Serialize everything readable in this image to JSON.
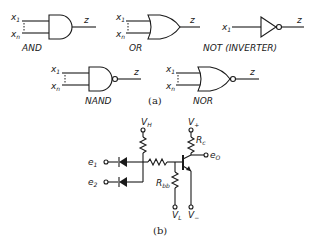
{
  "figure": {
    "part_a": {
      "caption": "(a)",
      "gates": [
        {
          "name": "AND",
          "label": "AND",
          "inputs": [
            "x1",
            "xn"
          ],
          "output": "z"
        },
        {
          "name": "OR",
          "label": "OR",
          "inputs": [
            "x1",
            "xn"
          ],
          "output": "z"
        },
        {
          "name": "NOT",
          "label": "NOT (INVERTER)",
          "inputs": [
            "x1"
          ],
          "output": "z"
        },
        {
          "name": "NAND",
          "label": "NAND",
          "inputs": [
            "x1",
            "xn"
          ],
          "output": "z"
        },
        {
          "name": "NOR",
          "label": "NOR",
          "inputs": [
            "x1",
            "xn"
          ],
          "output": "z"
        }
      ],
      "input_labels": {
        "first": "x",
        "first_sub": "1",
        "last": "x",
        "last_sub": "n"
      },
      "output_label": "z"
    },
    "part_b": {
      "caption": "(b)",
      "inputs": [
        {
          "label": "e",
          "sub": "1"
        },
        {
          "label": "e",
          "sub": "2"
        }
      ],
      "output": {
        "label": "e",
        "sub": "O"
      },
      "supplies": {
        "vh": {
          "label": "V",
          "sub": "H"
        },
        "vplus": {
          "label": "V",
          "sub": "+"
        },
        "vl": {
          "label": "V",
          "sub": "L"
        },
        "vminus": {
          "label": "V",
          "sub": "−"
        }
      },
      "resistors": {
        "rc": {
          "label": "R",
          "sub": "c"
        },
        "rbb": {
          "label": "R",
          "sub": "bb"
        }
      }
    }
  }
}
